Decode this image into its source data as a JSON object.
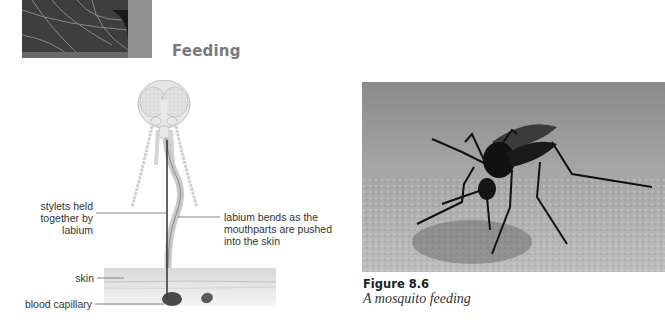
{
  "section": {
    "heading": "Feeding"
  },
  "diagram": {
    "labels": {
      "stylets_line1": "stylets held",
      "stylets_line2": "together by",
      "stylets_line3": "labium",
      "labium_line1": "labium bends as the",
      "labium_line2": "mouthparts are pushed",
      "labium_line3": "into the skin",
      "skin": "skin",
      "capillary": "blood capillary"
    }
  },
  "figure": {
    "number": "Figure 8.6",
    "caption": "A mosquito feeding"
  },
  "colors": {
    "heading": "#7a7a7a",
    "skin": "#e2e2e2",
    "label_text": "#333333"
  }
}
